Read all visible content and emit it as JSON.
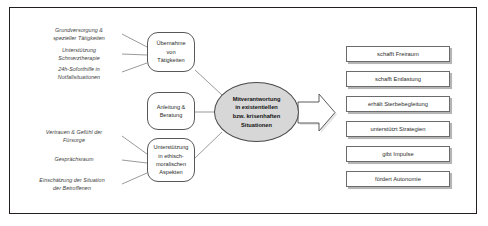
{
  "diagram": {
    "title_text": "",
    "colors": {
      "frame_border": "#231f20",
      "box_border": "#58585a",
      "ellipse_fill": "#d7d7d7",
      "arrow_fill": "#ffffff",
      "text": "#2b2b2b"
    },
    "annotations": [
      {
        "id": "ann-1",
        "lines": [
          "Grundversorgung &",
          "spezieller Tätigkeiten"
        ]
      },
      {
        "id": "ann-2",
        "lines": [
          "Unterstützung",
          "Schmerztherapie"
        ]
      },
      {
        "id": "ann-3",
        "lines": [
          "24h-Soforthilfe in",
          "Notfallsituationen"
        ]
      },
      {
        "id": "ann-4",
        "lines": [
          "Vertrauen & Gefühl der",
          "Fürsorge"
        ]
      },
      {
        "id": "ann-5",
        "lines": [
          "Gesprächsraum"
        ]
      },
      {
        "id": "ann-6",
        "lines": [
          "Einschätzung der Situation",
          "der Betroffenen"
        ]
      }
    ],
    "process_boxes": [
      {
        "id": "box-uebernahme",
        "lines": [
          "Übernahme",
          "von",
          "Tätigkeiten"
        ]
      },
      {
        "id": "box-anleitung",
        "lines": [
          "Anleitung &",
          "Beratung"
        ]
      },
      {
        "id": "box-unterstuetzung",
        "lines": [
          "Unterstützung",
          "in ethisch-",
          "moralischen",
          "Aspekten"
        ]
      }
    ],
    "core": {
      "id": "core-node",
      "lines": [
        "Mitverantwortung",
        "in existentiellen",
        "bzw. krisenhaften",
        "Situationen"
      ]
    },
    "arrow": {
      "id": "flow-arrow",
      "direction": "right"
    },
    "outcomes": [
      {
        "id": "outcome-1",
        "label": "schafft Freiraum"
      },
      {
        "id": "outcome-2",
        "label": "schafft Entlastung"
      },
      {
        "id": "outcome-3",
        "label": "erhält Sterbebegleitung"
      },
      {
        "id": "outcome-4",
        "label": "unterstützt Strategien"
      },
      {
        "id": "outcome-5",
        "label": "gibt Impulse"
      },
      {
        "id": "outcome-6",
        "label": "fördert Autonomie"
      }
    ]
  }
}
